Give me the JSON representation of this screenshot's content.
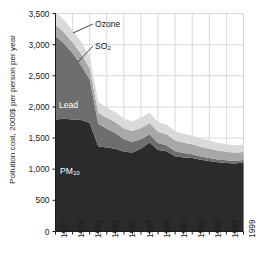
{
  "chart_data": {
    "type": "area",
    "stacked": true,
    "title": "",
    "subtitle": "",
    "xlabel": "",
    "ylabel": "Pollution cost, 2000$ per person per year",
    "xlim": [
      1977,
      1999
    ],
    "ylim": [
      0,
      3500
    ],
    "grid": true,
    "legend_position": "inline-annotations",
    "x": [
      1977,
      1978,
      1979,
      1980,
      1981,
      1982,
      1983,
      1984,
      1985,
      1986,
      1987,
      1988,
      1989,
      1990,
      1991,
      1992,
      1993,
      1994,
      1995,
      1996,
      1997,
      1998,
      1999
    ],
    "xtick_labels": [
      "1977",
      "1979",
      "1981",
      "1983",
      "1985",
      "1987",
      "1989",
      "1991",
      "1993",
      "1995",
      "1997",
      "1999"
    ],
    "ytick_labels": [
      "0",
      "500",
      "1,000",
      "1,500",
      "2,000",
      "2,500",
      "3,000",
      "3,500"
    ],
    "ytick_values": [
      0,
      500,
      1000,
      1500,
      2000,
      2500,
      3000,
      3500
    ],
    "series": [
      {
        "name": "PM10",
        "label": "PM",
        "label_subscript": "10",
        "color": "#2b2b2b",
        "values": [
          1800,
          1810,
          1800,
          1790,
          1740,
          1370,
          1350,
          1330,
          1280,
          1270,
          1330,
          1430,
          1310,
          1290,
          1210,
          1190,
          1180,
          1150,
          1130,
          1110,
          1100,
          1090,
          1110
        ]
      },
      {
        "name": "Lead",
        "label": "Lead",
        "color": "#6e6e6e",
        "values": [
          1340,
          1210,
          1060,
          880,
          700,
          360,
          300,
          250,
          200,
          170,
          150,
          130,
          110,
          95,
          80,
          70,
          60,
          55,
          50,
          45,
          42,
          40,
          38
        ]
      },
      {
        "name": "SO2",
        "label": "SO",
        "label_subscript": "2",
        "color": "#a8a8a8",
        "values": [
          180,
          175,
          175,
          180,
          180,
          175,
          175,
          175,
          175,
          175,
          180,
          180,
          180,
          175,
          170,
          165,
          160,
          155,
          150,
          145,
          140,
          135,
          130
        ]
      },
      {
        "name": "Ozone",
        "label": "Ozone",
        "color": "#d9d9d9",
        "values": [
          200,
          200,
          195,
          195,
          190,
          175,
          165,
          160,
          160,
          155,
          165,
          170,
          160,
          155,
          150,
          145,
          140,
          135,
          130,
          125,
          120,
          118,
          115
        ]
      }
    ],
    "annotations": [
      {
        "text": "Ozone",
        "kind": "outer-leader",
        "series": "Ozone"
      },
      {
        "text": "SO2",
        "kind": "outer-leader",
        "series": "SO2"
      },
      {
        "text": "Lead",
        "kind": "inner",
        "series": "Lead"
      },
      {
        "text": "PM10",
        "kind": "inner",
        "series": "PM10"
      }
    ]
  },
  "style": {
    "plot_background": "#ffffff",
    "grid_color": "#c8c8c8",
    "axis_color": "#1a1a1a",
    "text_color": "#1a1a1a",
    "inner_label_color": "#ffffff"
  }
}
